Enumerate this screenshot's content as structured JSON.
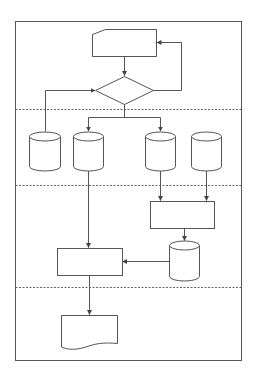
{
  "diagram": {
    "type": "flowchart",
    "colors": {
      "stroke": "#555555",
      "background": "#ffffff",
      "divider": "#666666"
    },
    "frame": {
      "x": 15,
      "y": 21,
      "w": 227,
      "h": 340
    },
    "lanes": [
      {
        "id": "lane-1",
        "y_top": 21,
        "y_bottom": 109
      },
      {
        "id": "lane-2",
        "y_top": 109,
        "y_bottom": 185
      },
      {
        "id": "lane-3",
        "y_top": 185,
        "y_bottom": 287
      },
      {
        "id": "lane-4",
        "y_top": 287,
        "y_bottom": 361
      }
    ],
    "nodes": [
      {
        "id": "manual-input",
        "shape": "manual-input",
        "label": ""
      },
      {
        "id": "decision",
        "shape": "diamond",
        "label": ""
      },
      {
        "id": "db-1",
        "shape": "cylinder",
        "label": ""
      },
      {
        "id": "db-2",
        "shape": "cylinder",
        "label": ""
      },
      {
        "id": "db-3",
        "shape": "cylinder",
        "label": ""
      },
      {
        "id": "db-4",
        "shape": "cylinder",
        "label": ""
      },
      {
        "id": "process-1",
        "shape": "rectangle",
        "label": ""
      },
      {
        "id": "db-5",
        "shape": "cylinder",
        "label": ""
      },
      {
        "id": "process-2",
        "shape": "rectangle",
        "label": ""
      },
      {
        "id": "document",
        "shape": "document",
        "label": ""
      }
    ],
    "edges": [
      {
        "from": "manual-input",
        "to": "decision"
      },
      {
        "from": "decision",
        "to": "manual-input",
        "note": "feedback loop"
      },
      {
        "from": "db-1",
        "to": "decision"
      },
      {
        "from": "decision",
        "to": "db-2"
      },
      {
        "from": "decision",
        "to": "db-3"
      },
      {
        "from": "db-3",
        "to": "process-1"
      },
      {
        "from": "db-4",
        "to": "process-1"
      },
      {
        "from": "process-1",
        "to": "db-5"
      },
      {
        "from": "db-5",
        "to": "process-2"
      },
      {
        "from": "db-2",
        "to": "process-2"
      },
      {
        "from": "process-2",
        "to": "document"
      }
    ]
  }
}
